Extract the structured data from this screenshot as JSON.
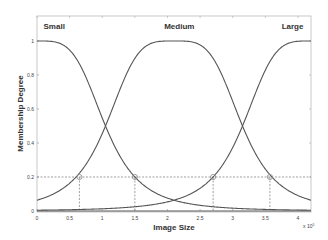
{
  "chart_data": {
    "type": "line",
    "title": "",
    "xlabel": "Image Size",
    "ylabel": "Membership Degree",
    "x_multiplier_label": "x 10",
    "x_multiplier_exponent": "5",
    "xlim": [
      0,
      4.2
    ],
    "ylim": [
      0,
      1.15
    ],
    "xticks": [
      0,
      0.5,
      1,
      1.5,
      2,
      2.5,
      3,
      3.5,
      4
    ],
    "xtick_labels": [
      "0",
      "0.5",
      "1",
      "1.5",
      "2",
      "2.5",
      "3",
      "3.5",
      "4"
    ],
    "yticks": [
      0,
      0.2,
      0.4,
      0.6,
      0.8,
      1
    ],
    "ytick_labels": [
      "0",
      "0.2",
      "0.4",
      "0.6",
      "0.8",
      "1"
    ],
    "grid": false,
    "legend": null,
    "curve_function": "generalized bell: 1/(1+|(x-c)/a|^(2b))",
    "x": [
      0,
      0.2,
      0.4,
      0.6,
      0.8,
      1.0,
      1.2,
      1.4,
      1.6,
      1.8,
      2.0,
      2.2,
      2.4,
      2.6,
      2.8,
      3.0,
      3.2,
      3.4,
      3.6,
      3.8,
      4.0,
      4.2
    ],
    "series": [
      {
        "name": "Small",
        "center": 0,
        "width": 1.05,
        "slope": 1.94,
        "values": [
          1.0,
          0.998,
          0.977,
          0.898,
          0.742,
          0.547,
          0.373,
          0.247,
          0.163,
          0.11,
          0.076,
          0.054,
          0.039,
          0.029,
          0.022,
          0.017,
          0.013,
          0.01,
          0.008,
          0.007,
          0.006,
          0.005
        ],
        "label_pos": [
          0.1,
          1.07
        ]
      },
      {
        "name": "Medium",
        "center": 2.1,
        "width": 1.05,
        "slope": 1.94,
        "values": [
          0.064,
          0.092,
          0.134,
          0.2,
          0.3,
          0.46,
          0.64,
          0.83,
          0.95,
          0.99,
          1.0,
          1.0,
          0.99,
          0.95,
          0.83,
          0.64,
          0.46,
          0.3,
          0.2,
          0.134,
          0.092,
          0.064
        ],
        "label_pos": [
          1.95,
          1.07
        ]
      },
      {
        "name": "Large",
        "center": 4.2,
        "width": 1.05,
        "slope": 1.94,
        "values": [
          0.005,
          0.006,
          0.007,
          0.008,
          0.01,
          0.013,
          0.017,
          0.022,
          0.029,
          0.039,
          0.054,
          0.076,
          0.11,
          0.163,
          0.247,
          0.373,
          0.547,
          0.742,
          0.898,
          0.977,
          0.998,
          1.0
        ],
        "label_pos": [
          3.75,
          1.07
        ]
      }
    ],
    "annotations": {
      "threshold_line_y": 0.2,
      "marked_points": [
        {
          "x": 0.65,
          "y": 0.2
        },
        {
          "x": 1.5,
          "y": 0.2
        },
        {
          "x": 2.7,
          "y": 0.2
        },
        {
          "x": 3.57,
          "y": 0.2
        }
      ]
    }
  }
}
